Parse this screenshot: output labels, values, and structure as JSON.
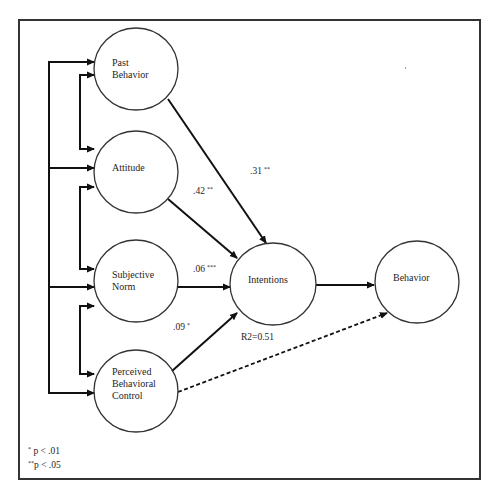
{
  "diagram": {
    "type": "path-model",
    "frame": {
      "x": 18,
      "y": 19,
      "w": 463,
      "h": 461
    },
    "line_color": "#111111",
    "circle_stroke": "#333333",
    "nodes": [
      {
        "id": "past_behavior",
        "label": "Past\nBehavior",
        "cx": 136,
        "cy": 69,
        "rx": 42,
        "ry": 41,
        "label_x": 112,
        "label_y": 57
      },
      {
        "id": "attitude",
        "label": "Attitude",
        "cx": 136,
        "cy": 172,
        "rx": 42,
        "ry": 41,
        "label_x": 112,
        "label_y": 162
      },
      {
        "id": "subjective_norm",
        "label": "Subjective\nNorm",
        "cx": 136,
        "cy": 281,
        "rx": 42,
        "ry": 41,
        "label_x": 112,
        "label_y": 269
      },
      {
        "id": "pbc",
        "label": "Perceived\nBehavioral\nControl",
        "cx": 136,
        "cy": 391,
        "rx": 42,
        "ry": 41,
        "label_x": 112,
        "label_y": 366
      },
      {
        "id": "intentions",
        "label": "Intentions",
        "cx": 273,
        "cy": 284,
        "rx": 43,
        "ry": 41,
        "label_x": 248,
        "label_y": 274
      },
      {
        "id": "behavior",
        "label": "Behavior",
        "cx": 417,
        "cy": 282,
        "rx": 42,
        "ry": 41,
        "label_x": 393,
        "label_y": 272
      }
    ],
    "paths": [
      {
        "from": "past_behavior",
        "to": "intentions",
        "x1": 168,
        "y1": 99,
        "x2": 266,
        "y2": 243,
        "style": "solid",
        "coefficient": ".31",
        "sig": "**",
        "label_x": 250,
        "label_y": 166
      },
      {
        "from": "attitude",
        "to": "intentions",
        "x1": 168,
        "y1": 199,
        "x2": 237,
        "y2": 258,
        "style": "solid",
        "coefficient": ".42",
        "sig": "**",
        "label_x": 193,
        "label_y": 186
      },
      {
        "from": "subjective_norm",
        "to": "intentions",
        "x1": 178,
        "y1": 287,
        "x2": 230,
        "y2": 287,
        "style": "solid",
        "coefficient": ".06",
        "sig": "***",
        "label_x": 193,
        "label_y": 264
      },
      {
        "from": "pbc",
        "to": "intentions",
        "x1": 172,
        "y1": 371,
        "x2": 237,
        "y2": 313,
        "style": "solid",
        "coefficient": ".09",
        "sig": "*",
        "label_x": 173,
        "label_y": 322
      },
      {
        "from": "intentions",
        "to": "behavior",
        "x1": 316,
        "y1": 285,
        "x2": 374,
        "y2": 285,
        "style": "solid",
        "coefficient": "",
        "sig": ""
      },
      {
        "from": "pbc",
        "to": "behavior",
        "x1": 178,
        "y1": 392,
        "x2": 387,
        "y2": 313,
        "style": "dashed",
        "coefficient": "",
        "sig": ""
      }
    ],
    "r_squared": {
      "text": "R2=0.51",
      "x": 241,
      "y": 332
    },
    "correlation_brackets": {
      "outer": {
        "x": 49,
        "y_top": 62,
        "y_bottom": 393,
        "arrows_y": [
          62,
          168,
          287,
          393
        ],
        "arrow_x_end": 94
      },
      "inner": [
        {
          "x": 80,
          "y_top": 75,
          "y_bottom": 149,
          "arrows_y": [
            75,
            149
          ]
        },
        {
          "x": 80,
          "y_top": 187,
          "y_bottom": 269,
          "arrows_y": [
            187,
            269
          ]
        },
        {
          "x": 80,
          "y_top": 306,
          "y_bottom": 374,
          "arrows_y": [
            306,
            374
          ]
        }
      ],
      "arrow_x_end": 94
    },
    "legend": [
      {
        "stars": "*",
        "text": " p < .01"
      },
      {
        "stars": "**",
        "text": "p < .05"
      }
    ]
  }
}
